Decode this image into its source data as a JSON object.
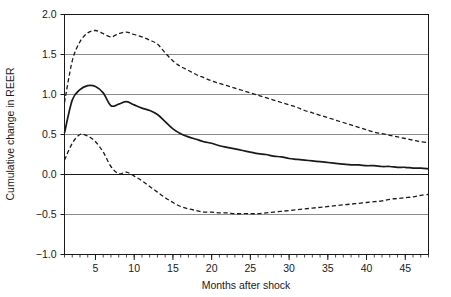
{
  "chart_data": {
    "type": "line",
    "title": "",
    "xlabel": "Months after shock",
    "ylabel": "Cumulative change in REER",
    "xlim": [
      1,
      48
    ],
    "ylim": [
      -1.0,
      2.0
    ],
    "grid": true,
    "legend": false,
    "x_ticks": [
      5,
      10,
      15,
      20,
      25,
      30,
      35,
      40,
      45
    ],
    "x_tick_labels": [
      "5",
      "10",
      "15",
      "20",
      "25",
      "30",
      "35",
      "40",
      "45"
    ],
    "x_minor_tick_step": 1,
    "y_ticks": [
      -1.0,
      -0.5,
      0.0,
      0.5,
      1.0,
      1.5,
      2.0
    ],
    "y_tick_labels": [
      "−1.0",
      "−0.5",
      "0.0",
      "0.5",
      "1.0",
      "1.5",
      "2.0"
    ],
    "x": [
      1,
      2,
      3,
      4,
      5,
      6,
      7,
      8,
      9,
      10,
      11,
      12,
      13,
      14,
      15,
      16,
      17,
      18,
      19,
      20,
      21,
      22,
      23,
      24,
      25,
      26,
      27,
      28,
      29,
      30,
      31,
      32,
      33,
      34,
      35,
      36,
      37,
      38,
      39,
      40,
      41,
      42,
      43,
      44,
      45,
      46,
      47,
      48
    ],
    "series": [
      {
        "name": "Upper confidence band",
        "style": "dashed",
        "color": "#1a1a1a",
        "values": [
          0.9,
          1.42,
          1.66,
          1.77,
          1.8,
          1.76,
          1.72,
          1.76,
          1.78,
          1.75,
          1.72,
          1.68,
          1.63,
          1.52,
          1.42,
          1.35,
          1.3,
          1.25,
          1.21,
          1.17,
          1.14,
          1.11,
          1.08,
          1.05,
          1.02,
          0.99,
          0.96,
          0.93,
          0.9,
          0.87,
          0.84,
          0.8,
          0.77,
          0.74,
          0.71,
          0.68,
          0.65,
          0.62,
          0.59,
          0.56,
          0.53,
          0.51,
          0.49,
          0.47,
          0.45,
          0.43,
          0.41,
          0.4
        ]
      },
      {
        "name": "Point estimate",
        "style": "solid",
        "color": "#1a1a1a",
        "values": [
          0.52,
          0.93,
          1.06,
          1.11,
          1.1,
          1.02,
          0.86,
          0.88,
          0.91,
          0.87,
          0.83,
          0.8,
          0.75,
          0.66,
          0.57,
          0.51,
          0.47,
          0.44,
          0.41,
          0.39,
          0.36,
          0.34,
          0.32,
          0.3,
          0.28,
          0.26,
          0.25,
          0.23,
          0.22,
          0.2,
          0.19,
          0.18,
          0.17,
          0.16,
          0.15,
          0.14,
          0.13,
          0.12,
          0.12,
          0.11,
          0.11,
          0.1,
          0.1,
          0.09,
          0.09,
          0.08,
          0.08,
          0.07
        ]
      },
      {
        "name": "Lower confidence band",
        "style": "dashed",
        "color": "#1a1a1a",
        "values": [
          0.18,
          0.39,
          0.5,
          0.48,
          0.41,
          0.28,
          0.1,
          0.01,
          0.03,
          -0.02,
          -0.08,
          -0.15,
          -0.22,
          -0.29,
          -0.35,
          -0.4,
          -0.43,
          -0.45,
          -0.47,
          -0.47,
          -0.48,
          -0.48,
          -0.49,
          -0.49,
          -0.49,
          -0.49,
          -0.48,
          -0.47,
          -0.46,
          -0.45,
          -0.44,
          -0.43,
          -0.42,
          -0.41,
          -0.4,
          -0.39,
          -0.38,
          -0.37,
          -0.36,
          -0.35,
          -0.34,
          -0.33,
          -0.31,
          -0.3,
          -0.29,
          -0.28,
          -0.26,
          -0.25
        ]
      }
    ]
  },
  "colors": {
    "axis": "#1a1a1a",
    "grid": "#8c8c8c",
    "line": "#1a1a1a",
    "background": "#ffffff"
  }
}
